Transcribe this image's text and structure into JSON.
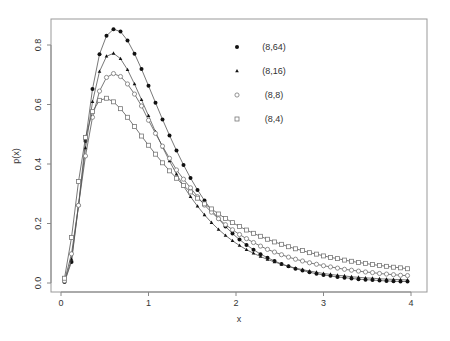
{
  "chart_data": {
    "type": "line",
    "title": "",
    "xlabel": "x",
    "ylabel": "p(x)",
    "xlim": [
      0,
      4
    ],
    "ylim": [
      0,
      0.85
    ],
    "x_ticks": [
      "0",
      "1",
      "2",
      "3",
      "4"
    ],
    "y_ticks": [
      "0.0",
      "0.2",
      "0.4",
      "0.6",
      "0.8"
    ],
    "grid": false,
    "legend_position": "top-right-inside",
    "x": [
      0.04,
      0.12,
      0.2,
      0.28,
      0.36,
      0.44,
      0.52,
      0.6,
      0.68,
      0.76,
      0.84,
      0.92,
      1.0,
      1.08,
      1.16,
      1.24,
      1.32,
      1.4,
      1.48,
      1.56,
      1.64,
      1.72,
      1.8,
      1.88,
      1.96,
      2.04,
      2.12,
      2.2,
      2.28,
      2.36,
      2.44,
      2.52,
      2.6,
      2.68,
      2.76,
      2.84,
      2.92,
      3.0,
      3.08,
      3.16,
      3.24,
      3.32,
      3.4,
      3.48,
      3.56,
      3.64,
      3.72,
      3.8,
      3.88,
      3.96
    ],
    "series": [
      {
        "name": "(8,64)",
        "marker": "filled-circle",
        "values": [
          0.003,
          0.071,
          0.261,
          0.477,
          0.652,
          0.769,
          0.831,
          0.853,
          0.845,
          0.815,
          0.771,
          0.719,
          0.663,
          0.606,
          0.55,
          0.496,
          0.445,
          0.397,
          0.353,
          0.313,
          0.277,
          0.245,
          0.216,
          0.19,
          0.166,
          0.146,
          0.128,
          0.112,
          0.097,
          0.085,
          0.074,
          0.064,
          0.056,
          0.048,
          0.042,
          0.036,
          0.031,
          0.027,
          0.024,
          0.02,
          0.018,
          0.015,
          0.013,
          0.011,
          0.01,
          0.008,
          0.007,
          0.006,
          0.005,
          0.005
        ]
      },
      {
        "name": "(8,16)",
        "marker": "filled-triangle",
        "values": [
          0.004,
          0.08,
          0.26,
          0.454,
          0.609,
          0.711,
          0.762,
          0.772,
          0.754,
          0.717,
          0.669,
          0.616,
          0.562,
          0.508,
          0.457,
          0.41,
          0.366,
          0.326,
          0.29,
          0.258,
          0.229,
          0.203,
          0.18,
          0.16,
          0.142,
          0.126,
          0.112,
          0.1,
          0.089,
          0.079,
          0.071,
          0.063,
          0.056,
          0.05,
          0.045,
          0.04,
          0.036,
          0.032,
          0.029,
          0.026,
          0.024,
          0.021,
          0.019,
          0.017,
          0.016,
          0.014,
          0.013,
          0.012,
          0.011,
          0.01
        ]
      },
      {
        "name": "(8,8)",
        "marker": "open-circle",
        "values": [
          0.007,
          0.098,
          0.261,
          0.427,
          0.557,
          0.645,
          0.691,
          0.704,
          0.694,
          0.669,
          0.635,
          0.595,
          0.547,
          0.503,
          0.46,
          0.419,
          0.38,
          0.349,
          0.32,
          0.29,
          0.262,
          0.238,
          0.216,
          0.196,
          0.179,
          0.163,
          0.149,
          0.136,
          0.124,
          0.113,
          0.104,
          0.095,
          0.087,
          0.08,
          0.074,
          0.068,
          0.063,
          0.058,
          0.054,
          0.05,
          0.046,
          0.043,
          0.04,
          0.037,
          0.035,
          0.032,
          0.03,
          0.028,
          0.026,
          0.025
        ]
      },
      {
        "name": "(8,4)",
        "marker": "open-square",
        "values": [
          0.016,
          0.153,
          0.341,
          0.489,
          0.576,
          0.614,
          0.621,
          0.609,
          0.586,
          0.557,
          0.526,
          0.494,
          0.463,
          0.433,
          0.404,
          0.377,
          0.352,
          0.328,
          0.306,
          0.285,
          0.266,
          0.249,
          0.232,
          0.217,
          0.203,
          0.19,
          0.178,
          0.167,
          0.157,
          0.147,
          0.138,
          0.13,
          0.122,
          0.115,
          0.109,
          0.102,
          0.097,
          0.091,
          0.086,
          0.082,
          0.077,
          0.073,
          0.069,
          0.066,
          0.062,
          0.059,
          0.056,
          0.053,
          0.051,
          0.048
        ]
      }
    ]
  },
  "legend": {
    "items": [
      {
        "label": "(8,64)",
        "marker": "filled-circle"
      },
      {
        "label": "(8,16)",
        "marker": "filled-triangle"
      },
      {
        "label": "(8,8)",
        "marker": "open-circle"
      },
      {
        "label": "(8,4)",
        "marker": "open-square"
      }
    ]
  },
  "colors": {
    "axis": "#888888",
    "line": "#555555",
    "filled_marker": "#111111",
    "open_marker": "#777777",
    "text": "#333333"
  }
}
